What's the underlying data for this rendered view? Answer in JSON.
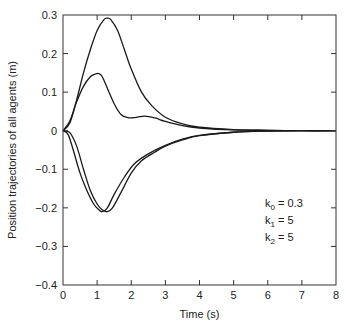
{
  "chart_data": {
    "type": "line",
    "title": "",
    "xlabel": "Time (s)",
    "ylabel": "Position trajectories of all agents (m)",
    "xlim": [
      0,
      8
    ],
    "ylim": [
      -0.4,
      0.3
    ],
    "xticks": [
      "0",
      "1",
      "2",
      "3",
      "4",
      "5",
      "6",
      "7",
      "8"
    ],
    "yticks": [
      "0.3",
      "0.2",
      "0.1",
      "0",
      "−0.1",
      "−0.2",
      "−0.3",
      "−0.4"
    ],
    "ytick_values": [
      0.3,
      0.2,
      0.1,
      0,
      -0.1,
      -0.2,
      -0.3,
      -0.4
    ],
    "grid": false,
    "legend": null,
    "annotations": [
      {
        "label": "k",
        "sub": "0",
        "value": " = 0.3"
      },
      {
        "label": "k",
        "sub": "1",
        "value": " = 5"
      },
      {
        "label": "k",
        "sub": "2",
        "value": " = 5"
      }
    ],
    "series": [
      {
        "name": "agent 1",
        "x": [
          0,
          0.2,
          0.4,
          0.6,
          0.8,
          1.0,
          1.2,
          1.3,
          1.4,
          1.6,
          1.8,
          2.0,
          2.3,
          2.6,
          3.0,
          3.5,
          4.0,
          5.0,
          6.0,
          7.0,
          8.0
        ],
        "y": [
          0,
          0.02,
          0.08,
          0.15,
          0.21,
          0.26,
          0.288,
          0.292,
          0.288,
          0.26,
          0.21,
          0.16,
          0.1,
          0.065,
          0.035,
          0.018,
          0.009,
          0.003,
          0.001,
          0.0,
          0.0
        ]
      },
      {
        "name": "agent 2",
        "x": [
          0,
          0.2,
          0.4,
          0.6,
          0.8,
          0.95,
          1.05,
          1.15,
          1.3,
          1.5,
          1.7,
          1.9,
          2.1,
          2.4,
          2.7,
          3.0,
          3.5,
          4.0,
          5.0,
          6.0,
          7.0,
          8.0
        ],
        "y": [
          0,
          0.025,
          0.075,
          0.115,
          0.14,
          0.147,
          0.148,
          0.14,
          0.11,
          0.07,
          0.042,
          0.034,
          0.034,
          0.038,
          0.033,
          0.024,
          0.013,
          0.007,
          0.002,
          0.001,
          0.0,
          0.0
        ]
      },
      {
        "name": "agent 3",
        "x": [
          0,
          0.15,
          0.3,
          0.5,
          0.7,
          0.9,
          1.05,
          1.15,
          1.3,
          1.5,
          1.8,
          2.1,
          2.5,
          3.0,
          3.5,
          4.0,
          5.0,
          6.0,
          7.0,
          8.0
        ],
        "y": [
          0,
          -0.01,
          -0.05,
          -0.11,
          -0.155,
          -0.19,
          -0.205,
          -0.21,
          -0.2,
          -0.165,
          -0.12,
          -0.085,
          -0.06,
          -0.038,
          -0.022,
          -0.012,
          -0.004,
          -0.001,
          0.0,
          0.0
        ]
      },
      {
        "name": "agent 4",
        "x": [
          0,
          0.2,
          0.4,
          0.6,
          0.8,
          1.0,
          1.15,
          1.3,
          1.45,
          1.7,
          2.0,
          2.3,
          2.7,
          3.0,
          3.5,
          4.0,
          5.0,
          6.0,
          7.0,
          8.0
        ],
        "y": [
          0,
          -0.005,
          -0.04,
          -0.1,
          -0.155,
          -0.19,
          -0.205,
          -0.21,
          -0.2,
          -0.16,
          -0.11,
          -0.078,
          -0.055,
          -0.04,
          -0.024,
          -0.013,
          -0.004,
          -0.001,
          0.0,
          0.0
        ]
      }
    ]
  }
}
